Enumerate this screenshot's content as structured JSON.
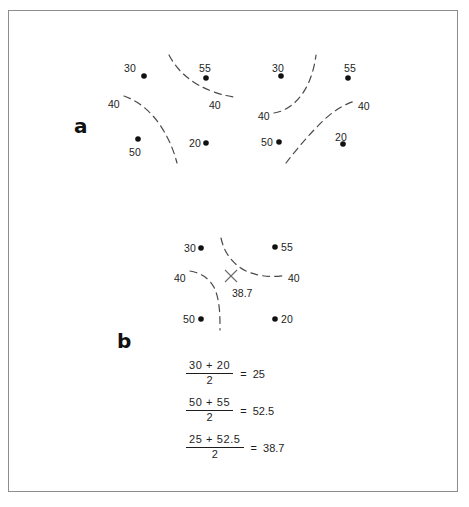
{
  "figure": {
    "background_color": "#ffffff",
    "frame_color": "#8d8d8d",
    "ink_color": "#1d1d1d",
    "panels": [
      {
        "letter": "a"
      },
      {
        "letter": "b"
      }
    ]
  },
  "panel_a": {
    "letter": "a",
    "left_grid": {
      "points": [
        {
          "label": "30",
          "x": 144,
          "y": 76,
          "label_x": 124,
          "label_y": 62
        },
        {
          "label": "55",
          "x": 206,
          "y": 78,
          "label_x": 199,
          "label_y": 62
        },
        {
          "label": "20",
          "x": 206,
          "y": 143,
          "label_x": 189,
          "label_y": 137
        },
        {
          "label": "50",
          "x": 138,
          "y": 139,
          "label_x": 129,
          "label_y": 146
        }
      ],
      "contour_labels": [
        {
          "value": "40",
          "x": 108,
          "y": 98
        },
        {
          "value": "40",
          "x": 209,
          "y": 99
        }
      ]
    },
    "right_grid": {
      "points": [
        {
          "label": "30",
          "x": 281,
          "y": 76,
          "label_x": 272,
          "label_y": 62
        },
        {
          "label": "55",
          "x": 348,
          "y": 78,
          "label_x": 344,
          "label_y": 62
        },
        {
          "label": "20",
          "x": 343,
          "y": 144,
          "label_x": 335,
          "label_y": 131
        },
        {
          "label": "50",
          "x": 279,
          "y": 142,
          "label_x": 261,
          "label_y": 136
        }
      ],
      "contour_labels": [
        {
          "value": "40",
          "x": 258,
          "y": 110
        },
        {
          "value": "40",
          "x": 358,
          "y": 100
        }
      ]
    }
  },
  "panel_b": {
    "letter": "b",
    "points": [
      {
        "label": "30",
        "x": 201,
        "y": 248,
        "label_x": 184,
        "label_y": 242
      },
      {
        "label": "55",
        "x": 275,
        "y": 247,
        "label_x": 281,
        "label_y": 241
      },
      {
        "label": "20",
        "x": 275,
        "y": 319,
        "label_x": 281,
        "label_y": 313
      },
      {
        "label": "50",
        "x": 201,
        "y": 319,
        "label_x": 183,
        "label_y": 313
      }
    ],
    "contour_labels": [
      {
        "value": "40",
        "x": 174,
        "y": 272
      },
      {
        "value": "40",
        "x": 288,
        "y": 272
      }
    ],
    "estimate_marker": {
      "symbol": "X",
      "x": 231,
      "y": 276
    },
    "estimate_value": "38.7",
    "estimate_label_x": 232,
    "estimate_label_y": 287
  },
  "equations": [
    {
      "numerator": "30 + 20",
      "denominator": "2",
      "equals": "=",
      "result": "25"
    },
    {
      "numerator": "50 + 55",
      "denominator": "2",
      "equals": "=",
      "result": "52.5"
    },
    {
      "numerator": "25 + 52.5",
      "denominator": "2",
      "equals": "=",
      "result": "38.7"
    }
  ]
}
